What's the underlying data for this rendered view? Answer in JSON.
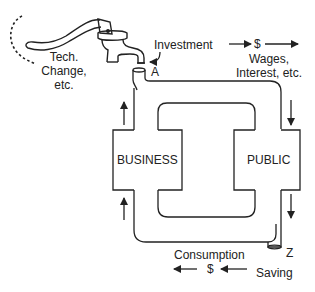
{
  "diagram": {
    "title": "",
    "type": "circular flow with pump",
    "nodes": {
      "business": {
        "label": "BUSINESS"
      },
      "public": {
        "label": "PUBLIC"
      }
    },
    "points": {
      "a": {
        "label": "A"
      },
      "z": {
        "label": "Z"
      }
    },
    "flows": {
      "investment": {
        "label": "Investment"
      },
      "wages": {
        "symbol": "$",
        "label_line1": "Wages,",
        "label_line2": "Interest, etc."
      },
      "consumption": {
        "label": "Consumption",
        "symbol": "$"
      },
      "saving": {
        "label": "Saving"
      }
    },
    "pump": {
      "label_line1": "Tech.",
      "label_line2": "Change,",
      "label_line3": "etc."
    },
    "colors": {
      "line": "#222222",
      "background": "#ffffff"
    }
  }
}
